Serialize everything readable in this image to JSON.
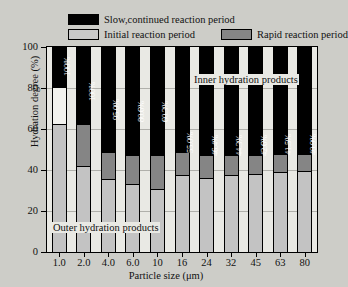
{
  "chart_data": {
    "type": "bar",
    "subtype": "stacked-bar",
    "title": "",
    "xlabel": "Particle size (μm)",
    "ylabel": "Hydration degree (%)",
    "ylim": [
      0,
      100
    ],
    "yticks": [
      0,
      20,
      40,
      60,
      80,
      100
    ],
    "ytick_labels": [
      "0",
      "20",
      "40",
      "60",
      "80",
      "100"
    ],
    "grid": true,
    "legend_position": "above-plot",
    "categories": [
      "1.0",
      "2.0",
      "4.0",
      "6.0",
      "10",
      "16",
      "24",
      "32",
      "45",
      "63",
      "80"
    ],
    "series": [
      {
        "name": "Initial reaction period",
        "color": "#c3c3c3",
        "values": [
          62.5,
          42.0,
          35.5,
          33.0,
          30.5,
          37.5,
          36.0,
          37.5,
          38.0,
          39.0,
          39.5
        ]
      },
      {
        "name": "Rapid reaction period",
        "color": "#858585",
        "values": [
          0.0,
          20.5,
          13.5,
          14.5,
          17.0,
          11.5,
          11.5,
          10.0,
          9.5,
          9.0,
          8.5
        ]
      },
      {
        "name": "Slow,continued reaction period",
        "color": "#000000",
        "values": [
          20.0,
          37.5,
          51.0,
          52.5,
          52.5,
          51.0,
          52.5,
          52.5,
          52.5,
          52.0,
          52.0
        ]
      }
    ],
    "bar_labels": [
      "100%",
      "100%",
      "95.0%",
      "80.6%",
      "60.3%",
      "55.0%",
      "46.4%",
      "44.3%",
      "42.6%",
      "41.5%",
      "40.9%"
    ],
    "annotations": [
      {
        "text": "Inner hydration products",
        "position": "upper-right"
      },
      {
        "text": "Outer hydration products",
        "position": "lower-left"
      }
    ]
  },
  "legend": {
    "items": [
      {
        "label": "Slow,continued reaction period",
        "swatch": "black"
      },
      {
        "label": "Initial reaction period",
        "swatch": "light-gray"
      },
      {
        "label": "Rapid reaction period",
        "swatch": "dark-gray"
      }
    ]
  },
  "colors": {
    "slow": "#000000",
    "initial": "#c3c3c3",
    "rapid": "#858585",
    "plot_background": "#e9e9e4",
    "page_background": "#cdcdc8",
    "gridline": "#b0b0ab"
  }
}
